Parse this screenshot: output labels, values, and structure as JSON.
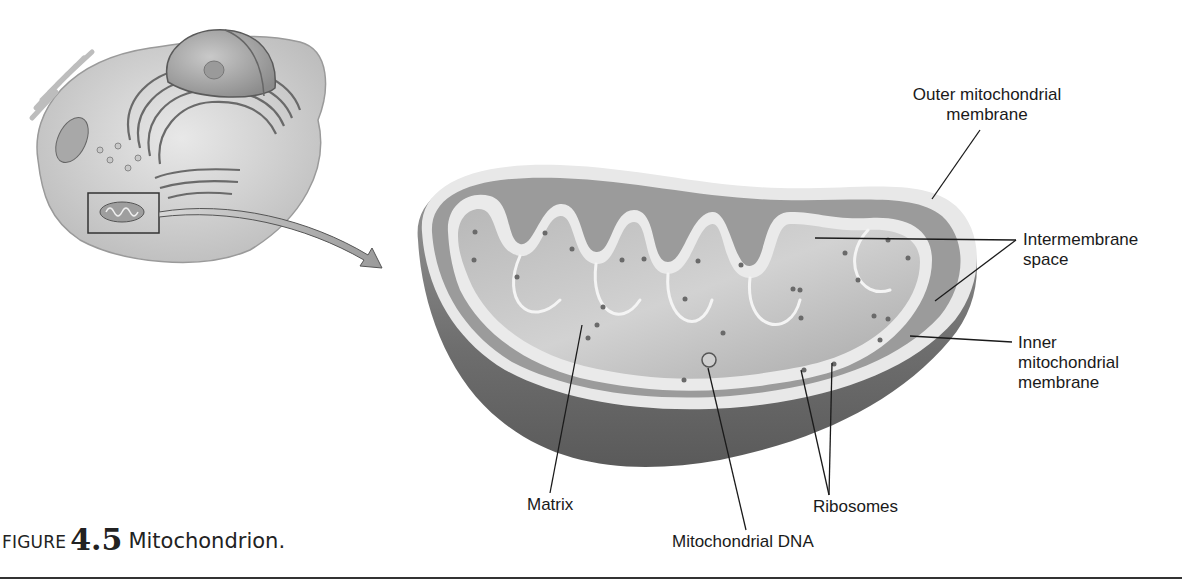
{
  "figure": {
    "caption_prefix": "FIGURE",
    "caption_number": "4.5",
    "caption_title": "Mitochondrion."
  },
  "labels": {
    "outer_membrane": "Outer mitochondrial\nmembrane",
    "intermembrane_space": "Intermembrane\nspace",
    "inner_membrane": "Inner\nmitochondrial\nmembrane",
    "matrix": "Matrix",
    "ribosomes": "Ribosomes",
    "mitochondrial_dna": "Mitochondrial DNA"
  },
  "colors": {
    "ink": "#1a1a1a",
    "outer_shell": "#7a7a7a",
    "membrane": "#e6e6e6",
    "matrix": "#c4c4c4",
    "rule": "#333333"
  }
}
